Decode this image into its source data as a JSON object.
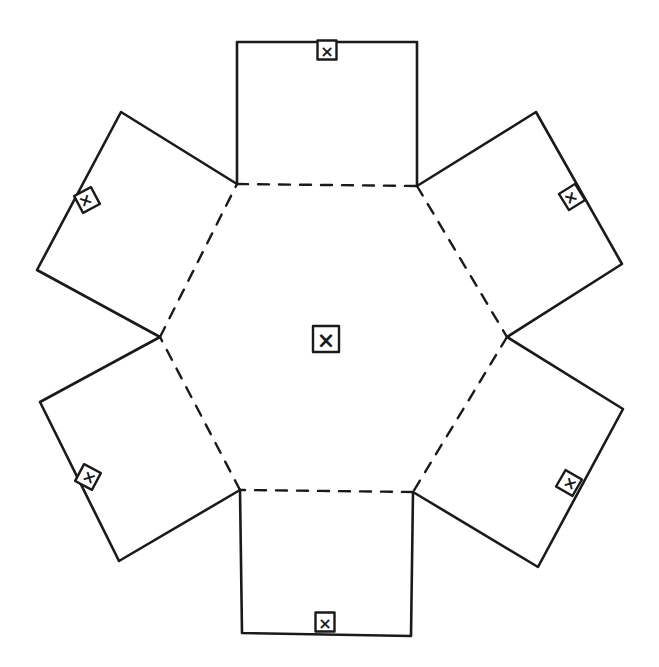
{
  "diagram": {
    "type": "hexagonal-box-net",
    "description": "Hand-drawn net of a hexagonal prism/box: a central hexagon bounded by dashed fold lines with six rectangular flaps, each flap carrying a small boxed X marker.",
    "colors": {
      "line": "#1a1a1a",
      "background": "#ffffff"
    },
    "center_panel": {
      "label": "hexagon-base",
      "marker": "x",
      "marker_pos": [
        326,
        339
      ]
    },
    "hexagon_vertices": [
      [
        237,
        184
      ],
      [
        417,
        186
      ],
      [
        507,
        337
      ],
      [
        413,
        492
      ],
      [
        240,
        490
      ],
      [
        160,
        337
      ]
    ],
    "fold_line_style": "dashed",
    "flaps": [
      {
        "name": "top",
        "polygon": [
          [
            237,
            184
          ],
          [
            237,
            42
          ],
          [
            417,
            42
          ],
          [
            417,
            186
          ]
        ],
        "marker": "x",
        "marker_pos": [
          327,
          50
        ],
        "marker_angle": 0
      },
      {
        "name": "upper-right",
        "polygon": [
          [
            417,
            186
          ],
          [
            536,
            112
          ],
          [
            622,
            264
          ],
          [
            507,
            337
          ]
        ],
        "marker": "x",
        "marker_pos": [
          572,
          197
        ],
        "marker_angle": 58
      },
      {
        "name": "lower-right",
        "polygon": [
          [
            507,
            337
          ],
          [
            623,
            409
          ],
          [
            538,
            567
          ],
          [
            413,
            492
          ]
        ],
        "marker": "x",
        "marker_pos": [
          569,
          483
        ],
        "marker_angle": -60
      },
      {
        "name": "bottom",
        "polygon": [
          [
            240,
            490
          ],
          [
            242,
            633
          ],
          [
            411,
            636
          ],
          [
            413,
            492
          ]
        ],
        "marker": "x",
        "marker_pos": [
          325,
          622
        ],
        "marker_angle": 0
      },
      {
        "name": "lower-left",
        "polygon": [
          [
            240,
            490
          ],
          [
            119,
            561
          ],
          [
            40,
            402
          ],
          [
            160,
            337
          ]
        ],
        "marker": "x",
        "marker_pos": [
          88,
          477
        ],
        "marker_angle": -62
      },
      {
        "name": "upper-left",
        "polygon": [
          [
            160,
            337
          ],
          [
            37,
            270
          ],
          [
            121,
            112
          ],
          [
            237,
            184
          ]
        ],
        "marker": "x",
        "marker_pos": [
          87,
          200
        ],
        "marker_angle": 62
      }
    ],
    "marker_glyph": "×"
  }
}
